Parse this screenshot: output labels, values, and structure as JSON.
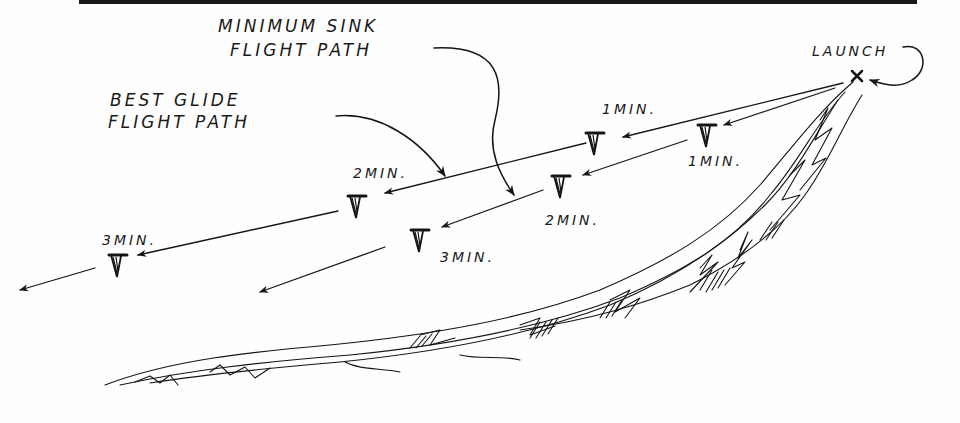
{
  "diagram": {
    "type": "hang-glider flight path comparison sketch",
    "colors": {
      "ink": "#151515",
      "paper": "#fefefe"
    },
    "labels": {
      "minimum_sink_line1": "MINIMUM SINK",
      "minimum_sink_line2": "FLIGHT PATH",
      "best_glide_line1": "BEST GLIDE",
      "best_glide_line2": "FLIGHT PATH",
      "launch": "LAUNCH"
    },
    "best_glide_path": {
      "markers": [
        {
          "time": "1MIN.",
          "x": 595,
          "y": 136
        },
        {
          "time": "2MIN.",
          "x": 357,
          "y": 205
        },
        {
          "time": "3MIN.",
          "x": 118,
          "y": 265
        }
      ]
    },
    "minimum_sink_path": {
      "markers": [
        {
          "time": "1MIN.",
          "x": 707,
          "y": 135
        },
        {
          "time": "2MIN.",
          "x": 560,
          "y": 185
        },
        {
          "time": "3MIN.",
          "x": 420,
          "y": 236
        }
      ]
    },
    "launch_point": {
      "x": 857,
      "y": 76
    }
  }
}
